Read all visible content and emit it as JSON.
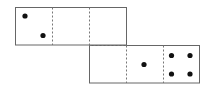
{
  "diagram": {
    "type": "cube-net",
    "faces": [
      {
        "row": 0,
        "col": 0,
        "pips": 2
      },
      {
        "row": 0,
        "col": 1,
        "pips": 0
      },
      {
        "row": 0,
        "col": 2,
        "pips": 0
      },
      {
        "row": 1,
        "col": 2,
        "pips": 0
      },
      {
        "row": 1,
        "col": 3,
        "pips": 1
      },
      {
        "row": 1,
        "col": 4,
        "pips": 4
      }
    ],
    "colors": {
      "border": "#555555",
      "fold": "#777777",
      "pip": "#111111"
    }
  }
}
